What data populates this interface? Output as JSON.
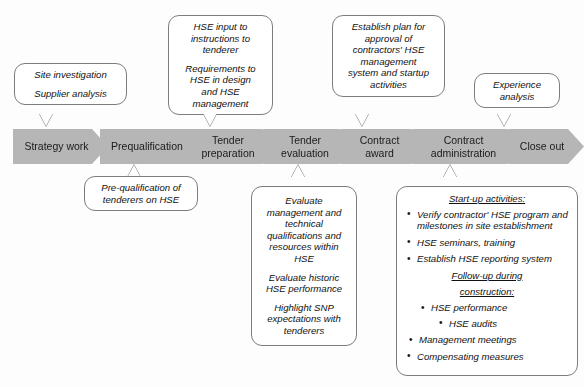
{
  "diagram": {
    "accent_gray": "#b6b6b6",
    "outline_gray": "#7d7d7d"
  },
  "process_steps": [
    {
      "id": "strategy-work",
      "label": "Strategy work"
    },
    {
      "id": "prequalification",
      "label": "Prequalification"
    },
    {
      "id": "tender-preparation",
      "line1": "Tender",
      "line2": "preparation"
    },
    {
      "id": "tender-evaluation",
      "line1": "Tender",
      "line2": "evaluation"
    },
    {
      "id": "contract-award",
      "line1": "Contract",
      "line2": "award"
    },
    {
      "id": "contract-administration",
      "line1": "Contract",
      "line2": "administration"
    },
    {
      "id": "close-out",
      "label": "Close out"
    }
  ],
  "callouts_top": {
    "strategy": {
      "lines": [
        "Site investigation",
        "Supplier analysis"
      ]
    },
    "tender_preparation": {
      "para1": [
        "HSE input to",
        "instructions to",
        "tenderer"
      ],
      "para2": [
        "Requirements to",
        "HSE in design",
        "and HSE",
        "management"
      ]
    },
    "contract_award": {
      "lines": [
        "Establish plan for",
        "approval of",
        "contractors' HSE",
        "management",
        "system and startup",
        "activities"
      ]
    },
    "close_out": {
      "lines": [
        "Experience",
        "analysis"
      ]
    }
  },
  "callouts_bottom": {
    "prequalification": {
      "lines": [
        "Pre-qualification of",
        "tenderers on HSE"
      ]
    },
    "tender_evaluation": {
      "para1": [
        "Evaluate",
        "management and",
        "technical",
        "qualifications and",
        "resources within",
        "HSE"
      ],
      "para2": [
        "Evaluate historic",
        "HSE performance"
      ],
      "para3": [
        "Highlight SNP",
        "expectations with",
        "tenderers"
      ]
    },
    "contract_administration": {
      "heading": "Start-up activities:",
      "items": [
        "Verify contractor' HSE program and milestones in site establishment",
        "HSE seminars, training",
        "Establish HSE reporting system"
      ],
      "subheading_line1": "Follow-up during",
      "subheading_line2": "construction:",
      "sub_items": [
        "HSE performance",
        "HSE audits"
      ],
      "tail_items": [
        "Management meetings",
        "Compensating measures"
      ]
    }
  }
}
